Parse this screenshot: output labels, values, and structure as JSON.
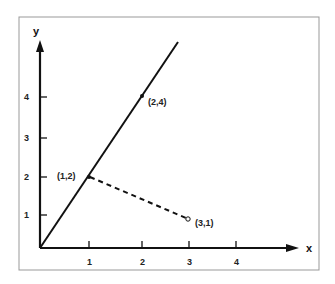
{
  "diagram": {
    "axes": {
      "x_label": "x",
      "y_label": "y",
      "x_ticks": [
        "1",
        "2",
        "3",
        "4"
      ],
      "y_ticks": [
        "1",
        "2",
        "3",
        "4"
      ]
    },
    "points": [
      {
        "label": "(1,2)",
        "x": 1,
        "y": 2
      },
      {
        "label": "(2,4)",
        "x": 2,
        "y": 4
      },
      {
        "label": "(3,1)",
        "x": 3,
        "y": 1
      }
    ],
    "lines": [
      {
        "from": [
          0,
          0
        ],
        "to": [
          2.85,
          5.2
        ],
        "style": "solid",
        "through": "(1,2) and (2,4)"
      },
      {
        "from": [
          1,
          2
        ],
        "to": [
          3,
          1
        ],
        "style": "dashed"
      }
    ],
    "colors": {
      "line": "#111111",
      "frame": "#999999",
      "background": "#ffffff"
    }
  }
}
